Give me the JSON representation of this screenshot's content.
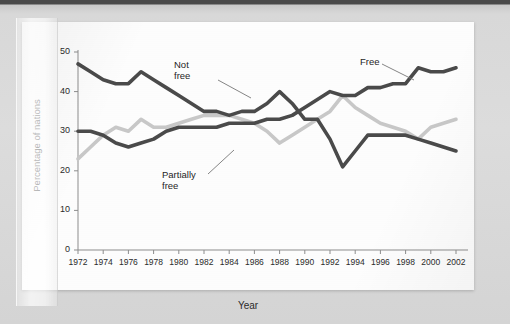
{
  "chart_data": {
    "type": "line",
    "title": "",
    "xlabel": "Year",
    "ylabel": "Percentage of nations",
    "xlim": [
      1972,
      2002
    ],
    "ylim": [
      0,
      50
    ],
    "grid": false,
    "legend_position": "inline-annotations",
    "x_ticks": [
      1972,
      1974,
      1976,
      1978,
      1980,
      1982,
      1984,
      1986,
      1988,
      1990,
      1992,
      1994,
      1996,
      1998,
      2000,
      2002
    ],
    "y_ticks": [
      0,
      10,
      20,
      30,
      40,
      50
    ],
    "x": [
      1972,
      1973,
      1974,
      1975,
      1976,
      1977,
      1978,
      1979,
      1980,
      1981,
      1982,
      1983,
      1984,
      1985,
      1986,
      1987,
      1988,
      1989,
      1990,
      1991,
      1992,
      1993,
      1994,
      1995,
      1996,
      1997,
      1998,
      1999,
      2000,
      2001,
      2002
    ],
    "series": [
      {
        "name": "Not free",
        "color": "#4a4a4a",
        "values": [
          47,
          45,
          43,
          42,
          42,
          45,
          43,
          41,
          39,
          37,
          35,
          35,
          34,
          35,
          35,
          37,
          40,
          37,
          33,
          33,
          28,
          21,
          25,
          29,
          29,
          29,
          29,
          28,
          27,
          26,
          25
        ]
      },
      {
        "name": "Free",
        "color": "#4a4a4a",
        "values": [
          30,
          30,
          29,
          27,
          26,
          27,
          28,
          30,
          31,
          31,
          31,
          31,
          32,
          32,
          32,
          33,
          33,
          34,
          36,
          38,
          40,
          39,
          39,
          41,
          41,
          42,
          42,
          46,
          45,
          45,
          46
        ]
      },
      {
        "name": "Partially free",
        "color": "#c8c8c8",
        "values": [
          23,
          26,
          29,
          31,
          30,
          33,
          31,
          31,
          32,
          33,
          34,
          34,
          34,
          33,
          32,
          30,
          27,
          29,
          31,
          33,
          35,
          39,
          36,
          34,
          32,
          31,
          30,
          28,
          31,
          32,
          33
        ]
      }
    ],
    "annotations": [
      {
        "text": "Not\nfree",
        "series": "Not free"
      },
      {
        "text": "Partially\nfree",
        "series": "Partially free"
      },
      {
        "text": "Free",
        "series": "Free"
      }
    ]
  },
  "axis": {
    "y_label": "Percentage of nations",
    "x_label": "Year",
    "y_ticks": [
      "0",
      "10",
      "20",
      "30",
      "40",
      "50"
    ],
    "x_ticks": [
      "1972",
      "1974",
      "1976",
      "1978",
      "1980",
      "1982",
      "1984",
      "1986",
      "1988",
      "1990",
      "1992",
      "1994",
      "1996",
      "1998",
      "2000",
      "2002"
    ]
  },
  "annotations": {
    "not_free_line1": "Not",
    "not_free_line2": "free",
    "partially_free_line1": "Partially",
    "partially_free_line2": "free",
    "free": "Free"
  }
}
